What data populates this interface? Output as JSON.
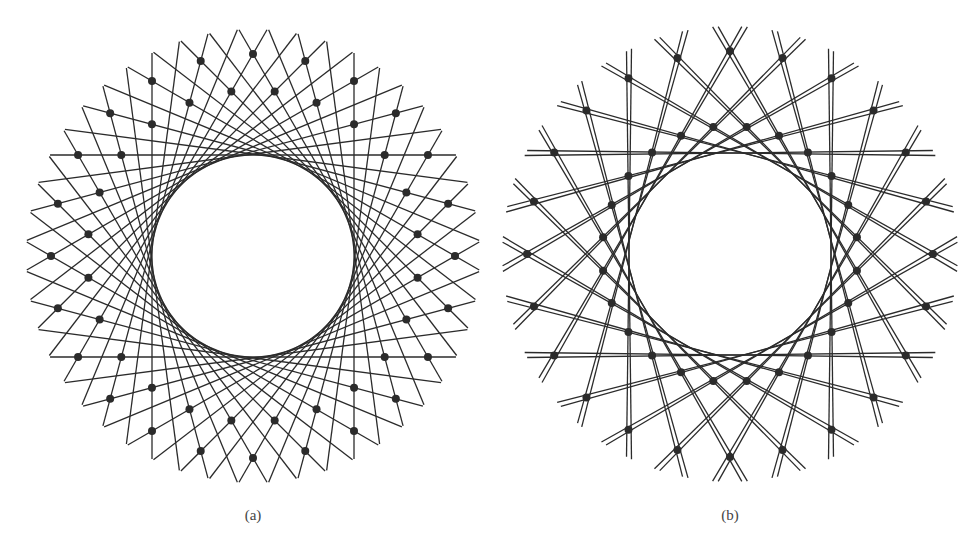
{
  "figures": [
    {
      "id": "a",
      "caption": "(a)",
      "center": [
        253,
        256
      ],
      "caption_pos": [
        253,
        519
      ],
      "tangent_radius": 101,
      "outer_radius": 202,
      "inner_radius": 166,
      "node_count": 24,
      "outer_node_offset_deg": 0,
      "inner_node_offset_deg": 7.5,
      "line_families": [
        {
          "normal_offset_deg": 0,
          "count": 24,
          "pairs": false
        },
        {
          "normal_offset_deg": 7.5,
          "count": 24,
          "pairs": false
        }
      ],
      "tail_length": 28,
      "stroke_color": "#2b2b2b",
      "node_color": "#2b2b2b",
      "node_radius": 4
    },
    {
      "id": "b",
      "caption": "(b)",
      "center": [
        730,
        254
      ],
      "caption_pos": [
        730,
        519
      ],
      "tangent_radius": 101,
      "outer_radius": 203,
      "inner_radius": 128,
      "node_count": 24,
      "outer_node_offset_deg": 0,
      "inner_node_offset_deg": 7.5,
      "line_families": [
        {
          "normal_offset_deg": 0,
          "count": 24,
          "pairs": true,
          "pair_split_deg": 1.4
        }
      ],
      "tail_length": 28,
      "stroke_color": "#2b2b2b",
      "node_color": "#2b2b2b",
      "node_radius": 4
    }
  ]
}
